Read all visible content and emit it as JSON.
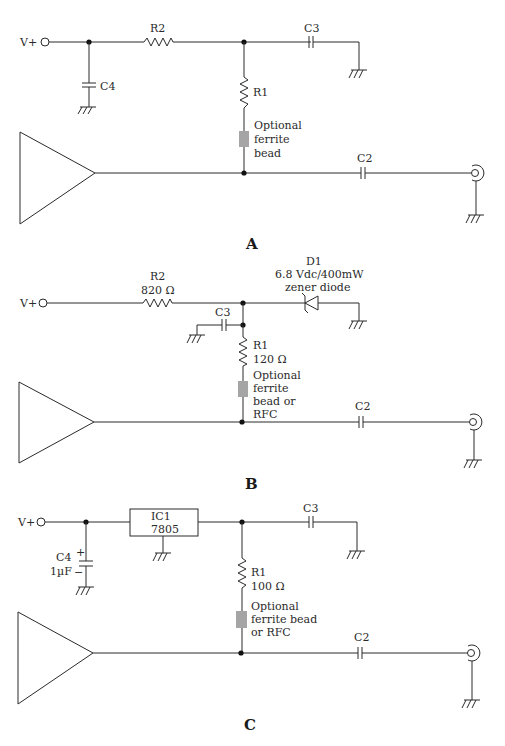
{
  "figure": {
    "panels": [
      {
        "id": "A",
        "label": "A",
        "supply": "V+",
        "components": {
          "R2": {
            "name": "R2"
          },
          "C4": {
            "name": "C4"
          },
          "R1": {
            "name": "R1"
          },
          "C3": {
            "name": "C3"
          },
          "C2": {
            "name": "C2"
          },
          "ferrite": {
            "lines": [
              "Optional",
              "ferrite",
              "bead"
            ]
          }
        }
      },
      {
        "id": "B",
        "label": "B",
        "supply": "V+",
        "components": {
          "R2": {
            "name": "R2",
            "value": "820 Ω"
          },
          "D1": {
            "name": "D1",
            "value": "6.8 Vdc/400mW",
            "type": "zener diode"
          },
          "C3": {
            "name": "C3"
          },
          "R1": {
            "name": "R1",
            "value": "120 Ω"
          },
          "C2": {
            "name": "C2"
          },
          "ferrite": {
            "lines": [
              "Optional",
              "ferrite",
              "bead or",
              "RFC"
            ]
          }
        }
      },
      {
        "id": "C",
        "label": "C",
        "supply": "V+",
        "components": {
          "IC1": {
            "name": "IC1",
            "value": "7805"
          },
          "C4": {
            "name": "C4",
            "value": "1µF",
            "plus": "+",
            "minus": "−"
          },
          "C3": {
            "name": "C3"
          },
          "R1": {
            "name": "R1",
            "value": "100 Ω"
          },
          "C2": {
            "name": "C2"
          },
          "ferrite": {
            "lines": [
              "Optional",
              "ferrite bead",
              "or RFC"
            ]
          }
        }
      }
    ],
    "colors": {
      "wire": "#2a2a2a",
      "ferrite": "#a5a5a5",
      "background": "#ffffff"
    }
  }
}
